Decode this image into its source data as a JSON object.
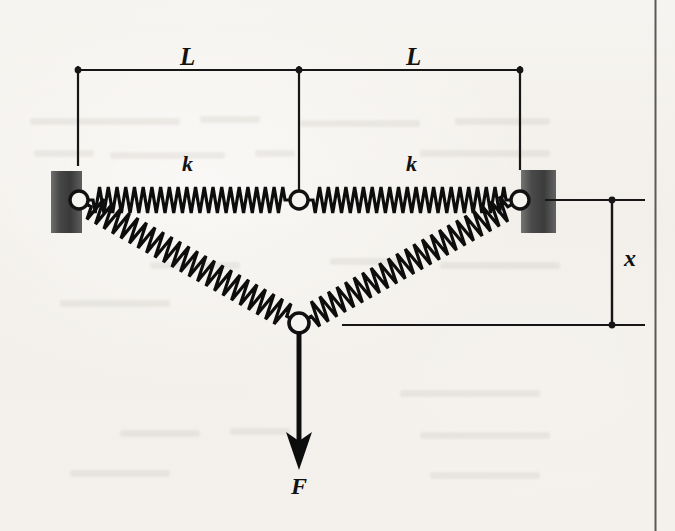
{
  "figure": {
    "kind": "mechanics-free-body-diagram",
    "background_color": "#f4f2ee",
    "ink_color": "#111111",
    "wall_color_dark": "#3a3a3a",
    "wall_color_light": "#8e8e8e"
  },
  "labels": {
    "length_left": "L",
    "length_right": "L",
    "stiffness_left": "k",
    "stiffness_right": "k",
    "displacement": "x",
    "force": "F"
  },
  "geometry": {
    "left_wall": {
      "x": 51,
      "y": 171,
      "width": 31,
      "height": 62
    },
    "right_wall": {
      "x": 521,
      "y": 170,
      "width": 35,
      "height": 63
    },
    "left_pin": {
      "cx": 79,
      "cy": 200,
      "r": 9
    },
    "center_pin": {
      "cx": 299,
      "cy": 200,
      "r": 9
    },
    "right_pin": {
      "cx": 520,
      "cy": 200,
      "r": 9
    },
    "bottom_pin": {
      "cx": 299,
      "cy": 323,
      "r": 10
    },
    "dimension_line_y": 70,
    "dimension_ticks_x": [
      78,
      299,
      520
    ],
    "dimension_tick_bottom_y": 166,
    "x_dimension_line_x": 612,
    "x_dimension_top_y": 200,
    "x_dimension_bottom_y": 325,
    "force_arrow": {
      "x": 299,
      "y_start": 331,
      "y_end": 466
    },
    "page_border_x": 655
  },
  "label_positions": {
    "length_left": {
      "x": 180,
      "y": 44
    },
    "length_right": {
      "x": 406,
      "y": 44
    },
    "stiffness_left": {
      "x": 182,
      "y": 153
    },
    "stiffness_right": {
      "x": 406,
      "y": 153
    },
    "displacement": {
      "x": 624,
      "y": 246
    },
    "force": {
      "x": 291,
      "y": 474
    }
  },
  "springs": [
    {
      "name": "top-left-spring",
      "from": "left_pin",
      "to": "center_pin",
      "coils": 22,
      "amplitude": 13
    },
    {
      "name": "top-right-spring",
      "from": "center_pin",
      "to": "right_pin",
      "coils": 22,
      "amplitude": 13
    },
    {
      "name": "lower-left-spring",
      "from": "left_pin",
      "to": "bottom_pin",
      "coils": 23,
      "amplitude": 13
    },
    {
      "name": "lower-right-spring",
      "from": "bottom_pin",
      "to": "right_pin",
      "coils": 23,
      "amplitude": 13
    }
  ]
}
